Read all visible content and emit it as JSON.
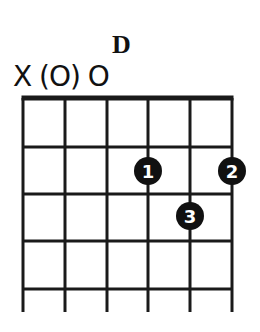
{
  "chord": {
    "name": "D",
    "open_markers": "X (O) O",
    "strings": 6,
    "frets_shown": 5,
    "string_x": [
      23,
      65,
      107,
      148,
      190,
      232
    ],
    "fret_y": [
      147,
      194,
      241,
      289
    ],
    "nut_y": 98,
    "bottom_y": 312,
    "fingers": [
      {
        "label": "1",
        "string": 4,
        "fret": 2,
        "cx": 148,
        "cy": 171
      },
      {
        "label": "2",
        "string": 6,
        "fret": 2,
        "cx": 232,
        "cy": 171
      },
      {
        "label": "3",
        "string": 5,
        "fret": 3,
        "cx": 190,
        "cy": 216
      }
    ],
    "colors": {
      "line": "#1a1a1a",
      "dot": "#111111",
      "dot_text": "#ffffff"
    }
  }
}
